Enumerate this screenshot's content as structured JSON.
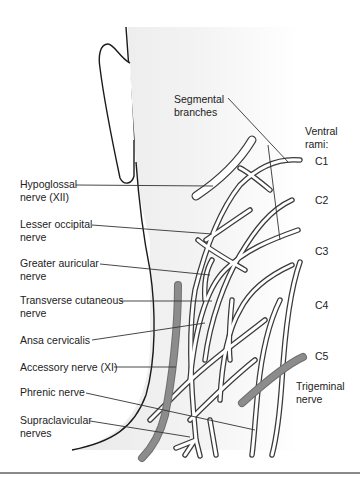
{
  "diagram": {
    "colors": {
      "skin_shading": "#efefef",
      "outline": "#1a1a1a",
      "cranial_nerve_fill": "#8c8c8c",
      "nerve_fill": "#ffffff",
      "leader_line": "#333333",
      "bottom_rule": "#8a8a8a"
    },
    "left_labels": [
      {
        "id": "hypoglossal",
        "line1": "Hypoglossal",
        "line2": "nerve (XII)"
      },
      {
        "id": "lesser-occipital",
        "line1": "Lesser occipital",
        "line2": "nerve"
      },
      {
        "id": "greater-auricular",
        "line1": "Greater auricular",
        "line2": "nerve"
      },
      {
        "id": "transverse-cutaneous",
        "line1": "Transverse cutaneous",
        "line2": "nerve"
      },
      {
        "id": "ansa-cervicalis",
        "line1": "Ansa cervicalis",
        "line2": ""
      },
      {
        "id": "accessory",
        "line1": "Accessory nerve (XI)",
        "line2": ""
      },
      {
        "id": "phrenic",
        "line1": "Phrenic nerve",
        "line2": ""
      },
      {
        "id": "supraclavicular",
        "line1": "Supraclavicular",
        "line2": "nerves"
      }
    ],
    "top_labels": {
      "segmental_line1": "Segmental",
      "segmental_line2": "branches",
      "ventral_line1": "Ventral",
      "ventral_line2": "rami:"
    },
    "rami": [
      "C1",
      "C2",
      "C3",
      "C4",
      "C5"
    ],
    "right_labels": {
      "trigeminal_line1": "Trigeminal",
      "trigeminal_line2": "nerve"
    }
  }
}
